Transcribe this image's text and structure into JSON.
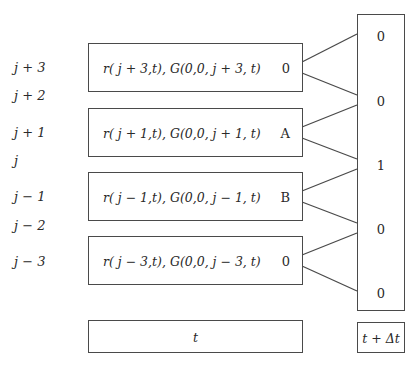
{
  "diagram": {
    "type": "lattice-transition",
    "row_labels": [
      "j + 3",
      "j + 2",
      "j + 1",
      "j",
      "j − 1",
      "j − 2",
      "j − 3"
    ],
    "left_nodes": [
      {
        "text": "r( j + 3,t), G(0,0, j + 3, t)",
        "value": "0"
      },
      {
        "text": "r( j + 1,t), G(0,0, j + 1, t)",
        "value": "A"
      },
      {
        "text": "r( j − 1,t), G(0,0, j − 1, t)",
        "value": "B"
      },
      {
        "text": "r( j − 3,t), G(0,0, j − 3, t)",
        "value": "0"
      }
    ],
    "right_values": [
      "0",
      "0",
      "1",
      "0",
      "0"
    ],
    "time_left": "t",
    "time_right": "t + Δt",
    "edges": [
      {
        "from": "left_nodes.0",
        "to": "right_values.0"
      },
      {
        "from": "left_nodes.0",
        "to": "right_values.1"
      },
      {
        "from": "left_nodes.1",
        "to": "right_values.1"
      },
      {
        "from": "left_nodes.1",
        "to": "right_values.2"
      },
      {
        "from": "left_nodes.2",
        "to": "right_values.2"
      },
      {
        "from": "left_nodes.2",
        "to": "right_values.3"
      },
      {
        "from": "left_nodes.3",
        "to": "right_values.3"
      },
      {
        "from": "left_nodes.3",
        "to": "right_values.4"
      }
    ],
    "colors": {
      "stroke": "#4a4a4a",
      "text": "#2a2a2a",
      "background": "#ffffff"
    }
  }
}
